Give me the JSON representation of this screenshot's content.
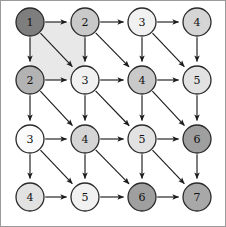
{
  "figure": {
    "type": "directed-grid-graph",
    "title": "",
    "width": 226,
    "height": 227,
    "background_color": "#ffffff",
    "frame_color": "#9a9a9a"
  },
  "layout": {
    "rows": 4,
    "cols": 4,
    "x_positions": [
      30,
      85,
      142,
      197
    ],
    "y_positions": [
      22,
      80,
      139,
      197
    ],
    "node_radius": 14
  },
  "palette": {
    "shade_1": "#7e7e7e",
    "shade_2": "#b3b3b3",
    "shade_3": "#c9c9c9",
    "shade_4": "#d5d5d5",
    "shade_5": "#e2e2e2",
    "shade_6": "#f1f1f1",
    "shade_7": "#fbfbfb",
    "node_stroke": "#2a2a2a",
    "edge_color": "#1d1d1d",
    "label_color": "#111111",
    "region_fill": "#e8e8e8"
  },
  "nodes": [
    {
      "id": "n00",
      "row": 0,
      "col": 0,
      "label": "1",
      "x": 30,
      "y": 22,
      "fill": "#7e7e7e"
    },
    {
      "id": "n01",
      "row": 0,
      "col": 1,
      "label": "2",
      "x": 85,
      "y": 22,
      "fill": "#c9c9c9"
    },
    {
      "id": "n02",
      "row": 0,
      "col": 2,
      "label": "3",
      "x": 142,
      "y": 22,
      "fill": "#f1f1f1"
    },
    {
      "id": "n03",
      "row": 0,
      "col": 3,
      "label": "4",
      "x": 197,
      "y": 22,
      "fill": "#d5d5d5"
    },
    {
      "id": "n10",
      "row": 1,
      "col": 0,
      "label": "2",
      "x": 30,
      "y": 80,
      "fill": "#b3b3b3"
    },
    {
      "id": "n11",
      "row": 1,
      "col": 1,
      "label": "3",
      "x": 85,
      "y": 80,
      "fill": "#f1f1f1"
    },
    {
      "id": "n12",
      "row": 1,
      "col": 2,
      "label": "4",
      "x": 142,
      "y": 80,
      "fill": "#c9c9c9"
    },
    {
      "id": "n13",
      "row": 1,
      "col": 3,
      "label": "5",
      "x": 197,
      "y": 80,
      "fill": "#e2e2e2"
    },
    {
      "id": "n20",
      "row": 2,
      "col": 0,
      "label": "3",
      "x": 30,
      "y": 139,
      "fill": "#fbfbfb"
    },
    {
      "id": "n21",
      "row": 2,
      "col": 1,
      "label": "4",
      "x": 85,
      "y": 139,
      "fill": "#d5d5d5"
    },
    {
      "id": "n22",
      "row": 2,
      "col": 2,
      "label": "5",
      "x": 142,
      "y": 139,
      "fill": "#e2e2e2"
    },
    {
      "id": "n23",
      "row": 2,
      "col": 3,
      "label": "6",
      "x": 197,
      "y": 139,
      "fill": "#9f9f9f"
    },
    {
      "id": "n30",
      "row": 3,
      "col": 0,
      "label": "4",
      "x": 30,
      "y": 197,
      "fill": "#e2e2e2"
    },
    {
      "id": "n31",
      "row": 3,
      "col": 1,
      "label": "5",
      "x": 85,
      "y": 197,
      "fill": "#f1f1f1"
    },
    {
      "id": "n32",
      "row": 3,
      "col": 2,
      "label": "6",
      "x": 142,
      "y": 197,
      "fill": "#9f9f9f"
    },
    {
      "id": "n33",
      "row": 3,
      "col": 3,
      "label": "7",
      "x": 197,
      "y": 197,
      "fill": "#a8a8a8"
    }
  ],
  "edges": [
    {
      "from": "n00",
      "to": "n01",
      "kind": "right"
    },
    {
      "from": "n01",
      "to": "n02",
      "kind": "right"
    },
    {
      "from": "n02",
      "to": "n03",
      "kind": "right"
    },
    {
      "from": "n10",
      "to": "n11",
      "kind": "right"
    },
    {
      "from": "n11",
      "to": "n12",
      "kind": "right"
    },
    {
      "from": "n12",
      "to": "n13",
      "kind": "right"
    },
    {
      "from": "n20",
      "to": "n21",
      "kind": "right"
    },
    {
      "from": "n21",
      "to": "n22",
      "kind": "right"
    },
    {
      "from": "n22",
      "to": "n23",
      "kind": "right"
    },
    {
      "from": "n30",
      "to": "n31",
      "kind": "right"
    },
    {
      "from": "n31",
      "to": "n32",
      "kind": "right"
    },
    {
      "from": "n32",
      "to": "n33",
      "kind": "right"
    },
    {
      "from": "n00",
      "to": "n10",
      "kind": "down"
    },
    {
      "from": "n01",
      "to": "n11",
      "kind": "down"
    },
    {
      "from": "n02",
      "to": "n12",
      "kind": "down"
    },
    {
      "from": "n03",
      "to": "n13",
      "kind": "down"
    },
    {
      "from": "n10",
      "to": "n20",
      "kind": "down"
    },
    {
      "from": "n11",
      "to": "n21",
      "kind": "down"
    },
    {
      "from": "n12",
      "to": "n22",
      "kind": "down"
    },
    {
      "from": "n13",
      "to": "n23",
      "kind": "down"
    },
    {
      "from": "n20",
      "to": "n30",
      "kind": "down"
    },
    {
      "from": "n21",
      "to": "n31",
      "kind": "down"
    },
    {
      "from": "n22",
      "to": "n32",
      "kind": "down"
    },
    {
      "from": "n23",
      "to": "n33",
      "kind": "down"
    },
    {
      "from": "n00",
      "to": "n11",
      "kind": "diagonal"
    },
    {
      "from": "n01",
      "to": "n12",
      "kind": "diagonal"
    },
    {
      "from": "n02",
      "to": "n13",
      "kind": "diagonal"
    },
    {
      "from": "n10",
      "to": "n21",
      "kind": "diagonal"
    },
    {
      "from": "n11",
      "to": "n22",
      "kind": "diagonal"
    },
    {
      "from": "n12",
      "to": "n23",
      "kind": "diagonal"
    },
    {
      "from": "n20",
      "to": "n31",
      "kind": "diagonal"
    },
    {
      "from": "n21",
      "to": "n32",
      "kind": "diagonal"
    },
    {
      "from": "n22",
      "to": "n33",
      "kind": "diagonal"
    }
  ],
  "highlighted_region": {
    "name": "top-left-cell-shading",
    "fill": "#e8e8e8",
    "points": [
      [
        30,
        22
      ],
      [
        85,
        22
      ],
      [
        85,
        80
      ],
      [
        30,
        80
      ]
    ]
  }
}
